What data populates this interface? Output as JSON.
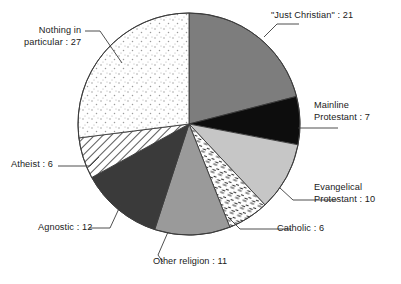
{
  "chart_data": {
    "type": "pie",
    "title": "",
    "subtitle": "",
    "xlabel": "",
    "ylabel": "",
    "total": 100,
    "legend_position": "callout-labels",
    "grid": false,
    "start_angle_deg": 0,
    "direction": "clockwise",
    "categories": [
      "\"Just Christian\"",
      "Mainline Protestant",
      "Evangelical Protestant",
      "Catholic",
      "Other religion",
      "Agnostic",
      "Atheist",
      "Nothing in particular"
    ],
    "values": [
      21,
      7,
      10,
      6,
      11,
      12,
      6,
      27
    ],
    "slices": [
      {
        "name": "just-christian",
        "label_line1": "\"Just Christian\" : 21",
        "label_line2": "",
        "category": "\"Just Christian\"",
        "value": 21,
        "fill": "#7d7d7d",
        "pattern": "solid"
      },
      {
        "name": "mainline-protestant",
        "label_line1": "Mainline",
        "label_line2": "Protestant : 7",
        "category": "Mainline Protestant",
        "value": 7,
        "fill": "#0d0d0d",
        "pattern": "solid"
      },
      {
        "name": "evangelical-protestant",
        "label_line1": "Evangelical",
        "label_line2": "Protestant : 10",
        "category": "Evangelical Protestant",
        "value": 10,
        "fill": "#c6c6c6",
        "pattern": "solid"
      },
      {
        "name": "catholic",
        "label_line1": "Catholic : 6",
        "label_line2": "",
        "category": "Catholic",
        "value": 6,
        "fill": "#ffffff",
        "pattern": "dashes"
      },
      {
        "name": "other-religion",
        "label_line1": "Other religion : 11",
        "label_line2": "",
        "category": "Other religion",
        "value": 11,
        "fill": "#9a9a9a",
        "pattern": "solid"
      },
      {
        "name": "agnostic",
        "label_line1": "Agnostic : 12",
        "label_line2": "",
        "category": "Agnostic",
        "value": 12,
        "fill": "#3a3a3a",
        "pattern": "solid"
      },
      {
        "name": "atheist",
        "label_line1": "Atheist : 6",
        "label_line2": "",
        "category": "Atheist",
        "value": 6,
        "fill": "#ffffff",
        "pattern": "diagonal-hatch"
      },
      {
        "name": "nothing-in-particular",
        "label_line1": "Nothing in",
        "label_line2": "particular : 27",
        "category": "Nothing in particular",
        "value": 27,
        "fill": "#ffffff",
        "pattern": "stipple-dots"
      }
    ],
    "colors": {
      "outline": "#3b3b3b",
      "leader_line": "#3b3b3b",
      "text": "#1a1a1a",
      "background": "#ffffff"
    },
    "geometry": {
      "center_x": 189,
      "center_y": 124,
      "radius": 111
    }
  }
}
